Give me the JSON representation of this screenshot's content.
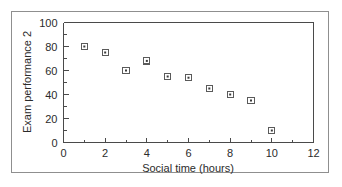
{
  "figure": {
    "frame_color": "#8f8f8f",
    "background": "#ffffff"
  },
  "chart_data": {
    "type": "scatter",
    "title": "",
    "xlabel": "Social time (hours)",
    "ylabel": "Exam performance 2",
    "xlim": [
      0,
      12
    ],
    "ylim": [
      0,
      100
    ],
    "grid": false,
    "legend": null,
    "marker": "square-with-center-dot",
    "marker_color": "#5a5a5a",
    "x": [
      1,
      2,
      3,
      4,
      5,
      6,
      7,
      8,
      9,
      10
    ],
    "values": [
      80,
      75,
      60,
      68,
      55,
      54,
      45,
      40,
      35,
      10
    ],
    "points": [
      {
        "x": 1,
        "y": 80
      },
      {
        "x": 2,
        "y": 75
      },
      {
        "x": 3,
        "y": 60
      },
      {
        "x": 4,
        "y": 68
      },
      {
        "x": 5,
        "y": 55
      },
      {
        "x": 6,
        "y": 54
      },
      {
        "x": 7,
        "y": 45
      },
      {
        "x": 8,
        "y": 40
      },
      {
        "x": 9,
        "y": 35
      },
      {
        "x": 10,
        "y": 10
      }
    ],
    "x_ticks": [
      0,
      2,
      4,
      6,
      8,
      10,
      12
    ],
    "x_tick_labels": [
      "0",
      "2",
      "4",
      "6",
      "8",
      "10",
      "12"
    ],
    "x_minor_ticks": [
      1,
      3,
      5,
      7,
      9,
      11
    ],
    "y_ticks": [
      0,
      20,
      40,
      60,
      80,
      100
    ],
    "y_tick_labels": [
      "0",
      "20",
      "40",
      "60",
      "80",
      "100"
    ],
    "y_minor_ticks": [
      10,
      30,
      50,
      70,
      90
    ]
  }
}
